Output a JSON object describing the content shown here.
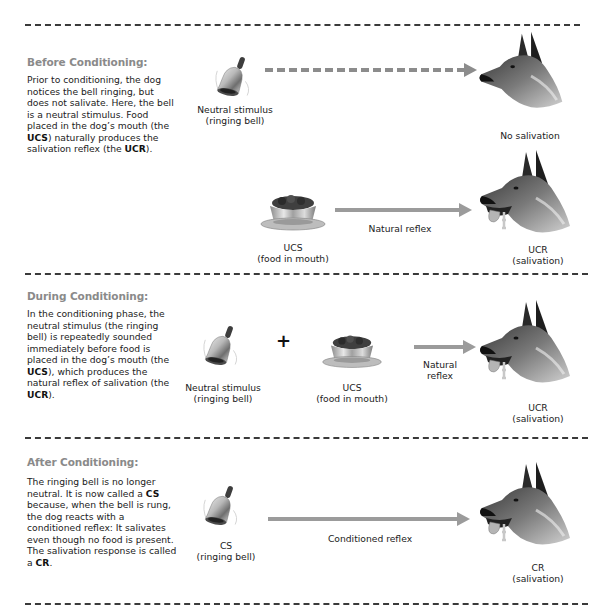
{
  "sections": [
    {
      "title": "Before Conditioning:",
      "description_parts": [
        {
          "text": "Prior to conditioning, the dog notices the bell ringing, but does not salivate. Here, the bell is a neutral stimulus. Food placed in the dog’s mouth (the ",
          "bold": false
        },
        {
          "text": "UCS",
          "bold": true
        },
        {
          "text": ") naturally produces the salivation reflex (the ",
          "bold": false
        },
        {
          "text": "UCR",
          "bold": true
        },
        {
          "text": ").",
          "bold": false
        }
      ],
      "rows": [
        {
          "stimulus": {
            "icon": "bell-icon",
            "line1": "Neutral stimulus",
            "line2": "(ringing bell)"
          },
          "arrow": {
            "style": "dashed",
            "label": ""
          },
          "response": {
            "icon": "dog-head-icon",
            "line1": "No salivation",
            "line2": ""
          }
        },
        {
          "stimulus": {
            "icon": "food-bowl-icon",
            "line1": "UCS",
            "line2": "(food in mouth)"
          },
          "arrow": {
            "style": "solid",
            "label": "Natural reflex"
          },
          "response": {
            "icon": "dog-head-salivating-icon",
            "line1": "UCR",
            "line2": "(salivation)"
          }
        }
      ]
    },
    {
      "title": "During Conditioning:",
      "description_parts": [
        {
          "text": "In the conditioning phase, the neutral stimulus (the ringing bell) is repeatedly sounded immediately before food is placed in the dog’s mouth (the ",
          "bold": false
        },
        {
          "text": "UCS",
          "bold": true
        },
        {
          "text": "), which produces the natural reflex of salivation (the ",
          "bold": false
        },
        {
          "text": "UCR",
          "bold": true
        },
        {
          "text": ").",
          "bold": false
        }
      ],
      "rows": [
        {
          "stimulus": {
            "icon": "bell-icon",
            "line1": "Neutral stimulus",
            "line2": "(ringing bell)"
          },
          "operator": "+",
          "stimulus2": {
            "icon": "food-bowl-icon",
            "line1": "UCS",
            "line2": "(food in mouth)"
          },
          "arrow": {
            "style": "solid",
            "label_line1": "Natural",
            "label_line2": "reflex"
          },
          "response": {
            "icon": "dog-head-salivating-icon",
            "line1": "UCR",
            "line2": "(salivation)"
          }
        }
      ]
    },
    {
      "title": "After Conditioning:",
      "description_parts": [
        {
          "text": "The ringing bell is no longer neutral. It is now called a ",
          "bold": false
        },
        {
          "text": "CS",
          "bold": true
        },
        {
          "text": " because, when the bell is rung, the dog reacts with a conditioned reflex: It salivates even though no food is present. The salivation response is called a ",
          "bold": false
        },
        {
          "text": "CR",
          "bold": true
        },
        {
          "text": ".",
          "bold": false
        }
      ],
      "rows": [
        {
          "stimulus": {
            "icon": "bell-icon",
            "line1": "CS",
            "line2": "(ringing bell)"
          },
          "arrow": {
            "style": "solid",
            "label": "Conditioned reflex"
          },
          "response": {
            "icon": "dog-head-salivating-icon",
            "line1": "CR",
            "line2": "(salivation)"
          }
        }
      ]
    }
  ],
  "colors": {
    "title_gray": "#8a8a8a",
    "arrow_gray": "#9b9b9b",
    "divider": "#3a3a3a",
    "text": "#222222"
  }
}
